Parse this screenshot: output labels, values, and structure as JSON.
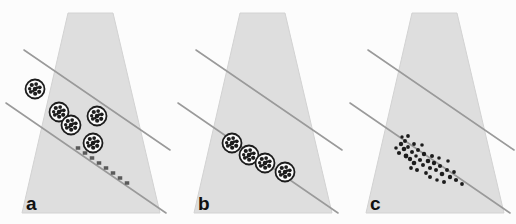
{
  "figure": {
    "background_color": "#fcfcfc",
    "width": 516,
    "height": 224,
    "panel_width": 172,
    "panel_height": 224
  },
  "style": {
    "cone_fill": "#dedede",
    "cone_edge": "#d2d2d2",
    "line_color": "#9a9a9a",
    "line_width": 1.6,
    "circle_stroke": "#1c1c1c",
    "circle_fill": "#fbfbfb",
    "speck_color": "#1c1c1c",
    "dot_color": "#1e1e1e",
    "square_color": "#5a5a5a",
    "label_color": "#111111"
  },
  "cone": {
    "top_left_x": 68,
    "top_right_x": 113,
    "top_y": 13,
    "bottom_left_x": 22,
    "bottom_right_x": 160,
    "bottom_y": 213
  },
  "guide_lines": [
    {
      "name": "upper-guide-line",
      "x1": 24,
      "y1": 50,
      "x2": 170,
      "y2": 150
    },
    {
      "name": "lower-guide-line",
      "x1": 6,
      "y1": 103,
      "x2": 166,
      "y2": 213
    }
  ],
  "panels": [
    {
      "id": "a",
      "label": "a",
      "label_x": 26,
      "label_y": 194,
      "offset_x": 0,
      "particle_style": "large-speckled-circles-scattered",
      "circles": [
        {
          "cx": 35,
          "cy": 89,
          "r": 9.5
        },
        {
          "cx": 59,
          "cy": 112,
          "r": 9.5
        },
        {
          "cx": 71,
          "cy": 125,
          "r": 9.5
        },
        {
          "cx": 97,
          "cy": 116,
          "r": 9.5
        },
        {
          "cx": 93,
          "cy": 143,
          "r": 9.5
        }
      ],
      "squares": [
        {
          "cx": 78,
          "cy": 148,
          "w": 4.5,
          "h": 3.5
        },
        {
          "cx": 85,
          "cy": 153,
          "w": 4.5,
          "h": 3.5
        },
        {
          "cx": 92,
          "cy": 158,
          "w": 4.5,
          "h": 3.5
        },
        {
          "cx": 99,
          "cy": 163,
          "w": 4.5,
          "h": 3.5
        },
        {
          "cx": 106,
          "cy": 168,
          "w": 4.5,
          "h": 3.5
        },
        {
          "cx": 113,
          "cy": 173,
          "w": 4.5,
          "h": 3.5
        },
        {
          "cx": 120,
          "cy": 178,
          "w": 4.5,
          "h": 3.5
        },
        {
          "cx": 127,
          "cy": 183,
          "w": 4.5,
          "h": 3.5
        }
      ],
      "dots": []
    },
    {
      "id": "b",
      "label": "b",
      "label_x": 26,
      "label_y": 194,
      "offset_x": 172,
      "particle_style": "large-speckled-circles-aligned",
      "circles": [
        {
          "cx": 60,
          "cy": 143,
          "r": 9.5
        },
        {
          "cx": 77,
          "cy": 155,
          "r": 9.5
        },
        {
          "cx": 93,
          "cy": 163,
          "r": 9.5
        },
        {
          "cx": 113,
          "cy": 172,
          "r": 9.5
        }
      ],
      "squares": [],
      "dots": []
    },
    {
      "id": "c",
      "label": "c",
      "label_x": 26,
      "label_y": 194,
      "offset_x": 344,
      "particle_style": "small-dots-cluster",
      "circles": [],
      "squares": [],
      "dots": [
        {
          "cx": 57,
          "cy": 144,
          "r": 2.2
        },
        {
          "cx": 61,
          "cy": 141,
          "r": 2.0
        },
        {
          "cx": 60,
          "cy": 149,
          "r": 2.3
        },
        {
          "cx": 64,
          "cy": 147,
          "r": 1.9
        },
        {
          "cx": 55,
          "cy": 153,
          "r": 2.1
        },
        {
          "cx": 62,
          "cy": 156,
          "r": 2.4
        },
        {
          "cx": 68,
          "cy": 152,
          "r": 2.0
        },
        {
          "cx": 66,
          "cy": 159,
          "r": 2.2
        },
        {
          "cx": 72,
          "cy": 156,
          "r": 1.8
        },
        {
          "cx": 70,
          "cy": 163,
          "r": 2.3
        },
        {
          "cx": 76,
          "cy": 160,
          "r": 2.1
        },
        {
          "cx": 74,
          "cy": 150,
          "r": 2.0
        },
        {
          "cx": 80,
          "cy": 154,
          "r": 2.2
        },
        {
          "cx": 79,
          "cy": 165,
          "r": 2.0
        },
        {
          "cx": 84,
          "cy": 161,
          "r": 2.3
        },
        {
          "cx": 86,
          "cy": 168,
          "r": 2.1
        },
        {
          "cx": 82,
          "cy": 173,
          "r": 1.9
        },
        {
          "cx": 90,
          "cy": 163,
          "r": 2.2
        },
        {
          "cx": 92,
          "cy": 170,
          "r": 2.0
        },
        {
          "cx": 96,
          "cy": 166,
          "r": 2.1
        },
        {
          "cx": 98,
          "cy": 174,
          "r": 2.3
        },
        {
          "cx": 103,
          "cy": 170,
          "r": 2.0
        },
        {
          "cx": 106,
          "cy": 177,
          "r": 2.2
        },
        {
          "cx": 110,
          "cy": 172,
          "r": 1.9
        },
        {
          "cx": 112,
          "cy": 180,
          "r": 2.1
        },
        {
          "cx": 100,
          "cy": 182,
          "r": 2.0
        },
        {
          "cx": 93,
          "cy": 180,
          "r": 1.8
        },
        {
          "cx": 86,
          "cy": 177,
          "r": 2.0
        },
        {
          "cx": 73,
          "cy": 170,
          "r": 2.0
        },
        {
          "cx": 67,
          "cy": 168,
          "r": 1.9
        },
        {
          "cx": 88,
          "cy": 156,
          "r": 2.0
        },
        {
          "cx": 78,
          "cy": 145,
          "r": 1.8
        },
        {
          "cx": 64,
          "cy": 136,
          "r": 1.9
        },
        {
          "cx": 58,
          "cy": 137,
          "r": 1.7
        },
        {
          "cx": 104,
          "cy": 161,
          "r": 1.8
        },
        {
          "cx": 118,
          "cy": 184,
          "r": 1.9
        },
        {
          "cx": 52,
          "cy": 148,
          "r": 1.8
        },
        {
          "cx": 70,
          "cy": 144,
          "r": 1.9
        },
        {
          "cx": 95,
          "cy": 158,
          "r": 1.8
        }
      ]
    }
  ],
  "speck_pattern": [
    {
      "dx": -0.34,
      "dy": -0.42,
      "r": 0.22
    },
    {
      "dx": 0.12,
      "dy": -0.52,
      "r": 0.2
    },
    {
      "dx": 0.5,
      "dy": -0.18,
      "r": 0.2
    },
    {
      "dx": 0.44,
      "dy": 0.3,
      "r": 0.22
    },
    {
      "dx": 0.02,
      "dy": 0.5,
      "r": 0.22
    },
    {
      "dx": -0.44,
      "dy": 0.3,
      "r": 0.2
    },
    {
      "dx": -0.56,
      "dy": -0.02,
      "r": 0.18
    },
    {
      "dx": 0.0,
      "dy": 0.0,
      "r": 0.24
    },
    {
      "dx": -0.18,
      "dy": 0.22,
      "r": 0.14
    },
    {
      "dx": 0.22,
      "dy": -0.14,
      "r": 0.14
    }
  ]
}
